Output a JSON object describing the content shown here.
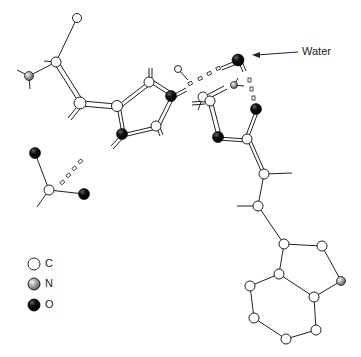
{
  "annotation": {
    "label": "Water"
  },
  "legend": {
    "items": [
      {
        "symbol": "C",
        "label": "C",
        "style": "open"
      },
      {
        "symbol": "N",
        "label": "N",
        "style": "stippled"
      },
      {
        "symbol": "O",
        "label": "O",
        "style": "filled"
      }
    ]
  },
  "colors": {
    "line": "#222222",
    "oxygen": "#111111",
    "nitrogen": "#888888",
    "carbon": "#ffffff"
  }
}
